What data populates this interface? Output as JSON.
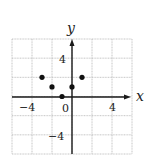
{
  "chart_data": {
    "type": "scatter",
    "title": "",
    "xlabel": "x",
    "ylabel": "y",
    "xlim": [
      -6,
      6
    ],
    "ylim": [
      -6,
      6
    ],
    "grid": true,
    "grid_step": 2,
    "x_tick_labels": [
      "-4",
      "0",
      "4"
    ],
    "y_tick_labels": [
      "4",
      "-4"
    ],
    "series": [
      {
        "name": "points",
        "points": [
          {
            "x": -3,
            "y": 2
          },
          {
            "x": -2,
            "y": 1
          },
          {
            "x": -1,
            "y": 0
          },
          {
            "x": 0,
            "y": 1
          },
          {
            "x": 1,
            "y": 2
          }
        ]
      }
    ],
    "colors": {
      "grid": "#b8b8b8",
      "axis": "#1a1a1a",
      "point": "#111111"
    }
  },
  "labels": {
    "x_axis": "x",
    "y_axis": "y",
    "x_tick_neg4": "−4",
    "x_tick_0": "0",
    "x_tick_4": "4",
    "y_tick_4": "4",
    "y_tick_neg4": "−4"
  }
}
